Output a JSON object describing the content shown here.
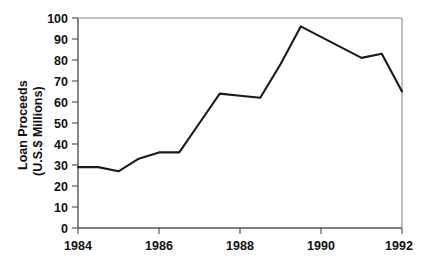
{
  "chart_data": {
    "type": "line",
    "title": "",
    "subtitle": "",
    "xlabel": "",
    "ylabel": "Loan Proceeds\n(U.S.$ Millions)",
    "ylabel_line1": "Loan Proceeds",
    "ylabel_line2": "(U.S.$ Millions)",
    "xlim": [
      1984,
      1992
    ],
    "ylim": [
      0,
      100
    ],
    "grid": false,
    "legend": "none",
    "x_tick_labels": [
      "1984",
      "1986",
      "1988",
      "1990",
      "1992"
    ],
    "x_tick_values": [
      1984,
      1986,
      1988,
      1990,
      1992
    ],
    "y_tick_labels": [
      "0",
      "10",
      "20",
      "30",
      "40",
      "50",
      "60",
      "70",
      "80",
      "90",
      "100"
    ],
    "y_tick_values": [
      0,
      10,
      20,
      30,
      40,
      50,
      60,
      70,
      80,
      90,
      100
    ],
    "series": [
      {
        "name": "Loan Proceeds",
        "color": "#1a1a1a",
        "x": [
          1984.0,
          1984.5,
          1985.0,
          1985.5,
          1986.0,
          1986.5,
          1987.0,
          1987.5,
          1988.0,
          1988.5,
          1989.0,
          1989.5,
          1990.0,
          1991.0,
          1991.5,
          1992.0
        ],
        "values": [
          29.0,
          29.0,
          27.0,
          33.0,
          36.0,
          36.0,
          50.0,
          64.0,
          63.0,
          62.0,
          78.0,
          96.0,
          91.0,
          81.0,
          83.0,
          65.0
        ]
      }
    ]
  },
  "axis_style": {
    "line_color": "#555555",
    "series_color": "#1a1a1a"
  }
}
